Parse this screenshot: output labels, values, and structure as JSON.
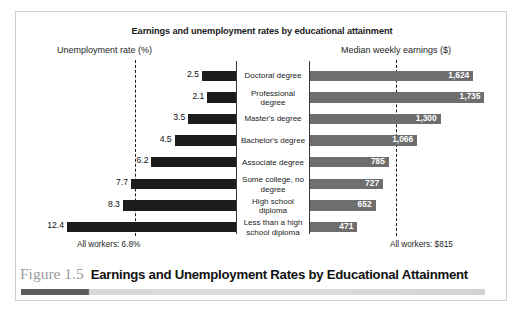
{
  "figure": {
    "chart_title": "Earnings and unemployment rates by educational attainment",
    "left_header": "Unemployment rate (%)",
    "right_header": "Median weekly earnings ($)",
    "left_footnote": "All workers: 6.8%",
    "right_footnote": "All workers: $815",
    "caption_number": "Figure 1.5",
    "caption_title": "Earnings and Unemployment Rates by Educational Attainment"
  },
  "colors": {
    "unemployment_bar": "#1c1c1c",
    "earnings_bar": "#6e6e6e",
    "axis": "#3a3a3a",
    "reference_line": "#1a1a1a",
    "caption_number": "#9b9b9b",
    "frame": "#cfcfcf"
  },
  "chart_data": {
    "type": "bar",
    "title": "Earnings and unemployment rates by educational attainment",
    "orientation": "horizontal",
    "layout": "back-to-back (bidirectional) paired bars with centered category labels",
    "grid": false,
    "legend_position": "none",
    "categories": [
      "Doctoral degree",
      "Professional degree",
      "Master's degree",
      "Bachelor's degree",
      "Associate degree",
      "Some college, no degree",
      "High school diploma",
      "Less than a high school diploma"
    ],
    "series": [
      {
        "name": "Unemployment rate (%)",
        "xlabel": "Unemployment rate (%)",
        "direction": "left",
        "unit": "%",
        "values": [
          2.5,
          2.1,
          3.5,
          4.5,
          6.2,
          7.7,
          8.3,
          12.4
        ],
        "value_labels": [
          "2.5",
          "2.1",
          "3.5",
          "4.5",
          "6.2",
          "7.7",
          "8.3",
          "12.4"
        ],
        "xlim": [
          0,
          13.2
        ],
        "reference_line": 6.8,
        "reference_label": "All workers: 6.8%"
      },
      {
        "name": "Median weekly earnings ($)",
        "xlabel": "Median weekly earnings ($)",
        "direction": "right",
        "unit": "$",
        "values": [
          1624,
          1735,
          1300,
          1066,
          785,
          727,
          652,
          471
        ],
        "value_labels": [
          "1,624",
          "1,735",
          "1,300",
          "1,066",
          "785",
          "727",
          "652",
          "471"
        ],
        "xlim": [
          0,
          1850
        ],
        "reference_line": 815,
        "reference_label": "All workers: $815"
      }
    ]
  }
}
